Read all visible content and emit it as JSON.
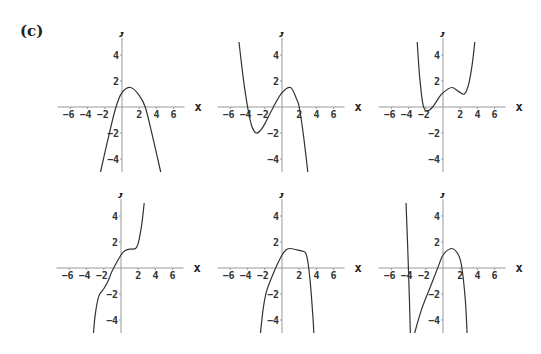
{
  "panel_label": "(c)",
  "axis": {
    "x_label": "x",
    "y_label": "y",
    "x_ticks": [
      -6,
      -4,
      -2,
      2,
      4,
      6
    ],
    "y_ticks": [
      4,
      2,
      -2,
      -4
    ],
    "xlim": [
      -7.5,
      7.5
    ],
    "ylim": [
      -5,
      5
    ]
  },
  "colors": {
    "axis": "#999999",
    "curve": "#333333",
    "text": "#333333"
  },
  "chart_data": [
    {
      "type": "line",
      "title": "",
      "xlabel": "x",
      "ylabel": "y",
      "xlim": [
        -7.5,
        7.5
      ],
      "ylim": [
        -5,
        5
      ],
      "grid": false,
      "series": [
        {
          "name": "curve",
          "x": [
            -2.5,
            -1.5,
            -0.7,
            0,
            1,
            2,
            2.7,
            3.5,
            4.5
          ],
          "y": [
            -5,
            -2.1,
            0,
            1.1,
            1.5,
            0.9,
            0,
            -2.1,
            -5
          ]
        }
      ]
    },
    {
      "type": "line",
      "title": "",
      "xlabel": "x",
      "ylabel": "y",
      "xlim": [
        -7.5,
        7.5
      ],
      "ylim": [
        -5,
        5
      ],
      "grid": false,
      "series": [
        {
          "name": "curve",
          "x": [
            -5,
            -4.5,
            -4,
            -3.5,
            -3,
            -2.5,
            -2,
            -1,
            0,
            1,
            1.7,
            2,
            2.5,
            3
          ],
          "y": [
            5,
            2.2,
            0,
            -1.5,
            -2,
            -1.8,
            -1.3,
            0,
            1.1,
            1.5,
            0.6,
            0,
            -2.2,
            -5
          ]
        }
      ]
    },
    {
      "type": "line",
      "title": "",
      "xlabel": "x",
      "ylabel": "y",
      "xlim": [
        -7.5,
        7.5
      ],
      "ylim": [
        -5,
        5
      ],
      "grid": false,
      "series": [
        {
          "name": "curve",
          "x": [
            -3,
            -2.7,
            -2.3,
            -1.8,
            -1.2,
            -0.5,
            0,
            1,
            1.8,
            2.5,
            3,
            3.4,
            3.7
          ],
          "y": [
            5,
            2.2,
            0.1,
            -0.3,
            0,
            0.7,
            1.1,
            1.5,
            1.2,
            1.0,
            1.8,
            3.3,
            5
          ]
        }
      ]
    },
    {
      "type": "line",
      "title": "",
      "xlabel": "x",
      "ylabel": "y",
      "xlim": [
        -7.5,
        7.5
      ],
      "ylim": [
        -5,
        5
      ],
      "grid": false,
      "series": [
        {
          "name": "curve",
          "x": [
            -3.2,
            -3,
            -2.6,
            -2,
            -1.5,
            -1,
            0,
            0.5,
            1,
            1.7,
            2,
            2.4,
            2.7
          ],
          "y": [
            -5,
            -3.6,
            -2.2,
            -1.6,
            -1.0,
            -0.2,
            1.0,
            1.35,
            1.45,
            1.5,
            1.9,
            3.3,
            5
          ]
        }
      ]
    },
    {
      "type": "line",
      "title": "",
      "xlabel": "x",
      "ylabel": "y",
      "xlim": [
        -7.5,
        7.5
      ],
      "ylim": [
        -5,
        5
      ],
      "grid": false,
      "series": [
        {
          "name": "curve",
          "x": [
            -2.5,
            -2.2,
            -1.8,
            -1,
            0,
            0.5,
            1,
            2,
            2.7,
            3,
            3.3,
            3.6,
            3.7
          ],
          "y": [
            -5,
            -3.2,
            -1.8,
            -0.4,
            1.0,
            1.4,
            1.5,
            1.35,
            1.2,
            0.5,
            -1.2,
            -3.8,
            -5
          ]
        }
      ]
    },
    {
      "type": "line",
      "title": "",
      "xlabel": "x",
      "ylabel": "y",
      "xlim": [
        -7.5,
        7.5
      ],
      "ylim": [
        -5,
        5
      ],
      "grid": false,
      "series": [
        {
          "name": "curve-left",
          "x": [
            -4.3,
            -4.1,
            -3.9,
            -3.8
          ],
          "y": [
            5,
            1.5,
            -2.5,
            -5
          ]
        },
        {
          "name": "curve-right",
          "x": [
            -3.3,
            -2.5,
            -1.5,
            -0.5,
            0,
            1,
            1.8,
            2.2,
            2.6,
            2.8
          ],
          "y": [
            -5,
            -3.2,
            -1.5,
            0.2,
            1.0,
            1.5,
            1.0,
            0,
            -2.5,
            -5
          ]
        }
      ]
    }
  ]
}
